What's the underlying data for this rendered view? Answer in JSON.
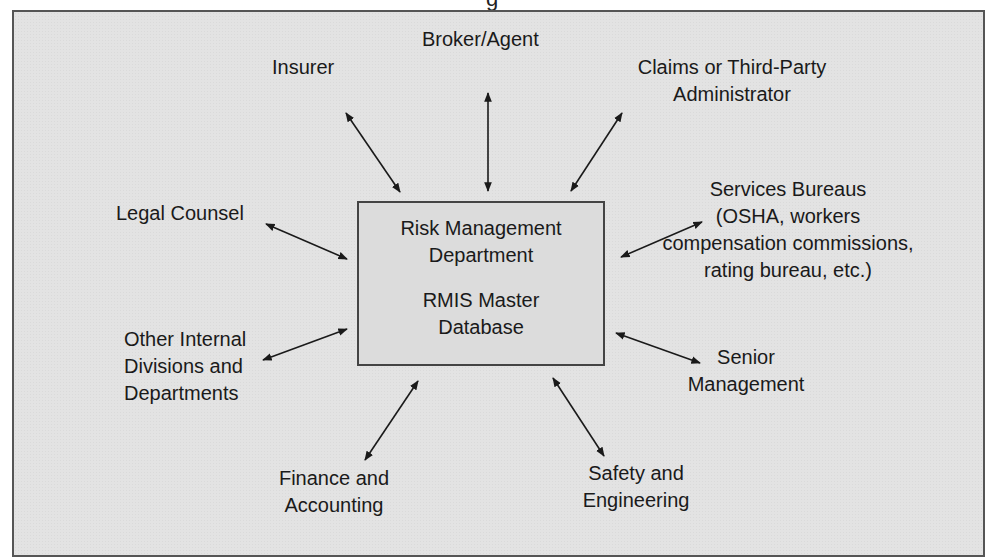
{
  "clipped_title_fragment": "g",
  "center": {
    "line1": "Risk Management",
    "line2": "Department",
    "line3": "RMIS Master",
    "line4": "Database"
  },
  "nodes": {
    "insurer": [
      "Insurer"
    ],
    "broker": [
      "Broker/Agent"
    ],
    "claims": [
      "Claims or Third-Party",
      "Administrator"
    ],
    "services": [
      "Services Bureaus",
      "(OSHA, workers",
      "compensation commissions,",
      "rating bureau, etc.)"
    ],
    "senior": [
      "Senior",
      "Management"
    ],
    "safety": [
      "Safety and",
      "Engineering"
    ],
    "finance": [
      "Finance and",
      "Accounting"
    ],
    "other": [
      "Other Internal",
      "Divisions and",
      "Departments"
    ],
    "legal": [
      "Legal Counsel"
    ]
  },
  "colors": {
    "background": "#e3e3e3",
    "box": "#dcdcdc",
    "stroke": "#1a1a1a"
  }
}
